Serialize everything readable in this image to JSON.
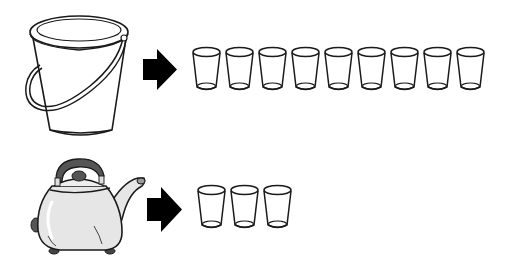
{
  "scene": {
    "description": "Capacity comparison illustration",
    "rows": [
      {
        "container": "bucket",
        "container_icon": "bucket-icon",
        "arrow_icon": "arrow-right-icon",
        "cup_icon": "cup-icon",
        "cup_count": 9
      },
      {
        "container": "kettle",
        "container_icon": "kettle-icon",
        "arrow_icon": "arrow-right-icon",
        "cup_icon": "cup-icon",
        "cup_count": 3
      }
    ]
  },
  "colors": {
    "line": "#1a1a1a",
    "arrow": "#000000",
    "kettle_handle": "#555555",
    "kettle_body": "#e6e6e6",
    "background": "#ffffff"
  }
}
